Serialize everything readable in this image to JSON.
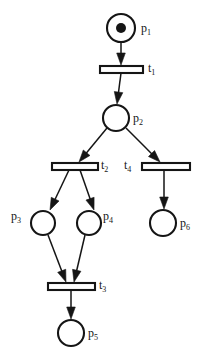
{
  "diagram": {
    "type": "petri-net",
    "width": 203,
    "height": 364,
    "background_color": "#ffffff",
    "stroke_color": "#151515",
    "fill_color": "#ffffff",
    "token_color": "#151515"
  },
  "places": [
    {
      "id": "p1",
      "label_base": "p",
      "label_sub": "1",
      "cx": 121,
      "cy": 28,
      "r": 14,
      "tokens": 1,
      "token_r": 5,
      "label_x": 141,
      "label_y": 22,
      "label_side": "right"
    },
    {
      "id": "p2",
      "label_base": "p",
      "label_sub": "2",
      "cx": 116,
      "cy": 118,
      "r": 13,
      "tokens": 0,
      "token_r": 5,
      "label_x": 133,
      "label_y": 112,
      "label_side": "right"
    },
    {
      "id": "p3",
      "label_base": "p",
      "label_sub": "3",
      "cx": 43,
      "cy": 223,
      "r": 12,
      "tokens": 0,
      "token_r": 5,
      "label_x": 11,
      "label_y": 210,
      "label_side": "left"
    },
    {
      "id": "p4",
      "label_base": "p",
      "label_sub": "4",
      "cx": 89,
      "cy": 223,
      "r": 12,
      "tokens": 0,
      "token_r": 5,
      "label_x": 103,
      "label_y": 210,
      "label_side": "right"
    },
    {
      "id": "p5",
      "label_base": "p",
      "label_sub": "5",
      "cx": 71,
      "cy": 333,
      "r": 13,
      "tokens": 0,
      "token_r": 5,
      "label_x": 88,
      "label_y": 327,
      "label_side": "right"
    },
    {
      "id": "p6",
      "label_base": "p",
      "label_sub": "6",
      "cx": 163,
      "cy": 223,
      "r": 13,
      "tokens": 0,
      "token_r": 5,
      "label_x": 180,
      "label_y": 217,
      "label_side": "right"
    }
  ],
  "transitions": [
    {
      "id": "t1",
      "label_base": "t",
      "label_sub": "1",
      "x": 100,
      "y": 66,
      "width": 43,
      "height": 7,
      "label_x": 148,
      "label_y": 62,
      "label_side": "right"
    },
    {
      "id": "t2",
      "label_base": "t",
      "label_sub": "2",
      "x": 52,
      "y": 163,
      "width": 46,
      "height": 7,
      "label_x": 101,
      "label_y": 159,
      "label_side": "right"
    },
    {
      "id": "t3",
      "label_base": "t",
      "label_sub": "3",
      "x": 48,
      "y": 283,
      "width": 47,
      "height": 7,
      "label_x": 99,
      "label_y": 279,
      "label_side": "right"
    },
    {
      "id": "t4",
      "label_base": "t",
      "label_sub": "4",
      "x": 142,
      "y": 163,
      "width": 48,
      "height": 7,
      "label_x": 124,
      "label_y": 159,
      "label_side": "left"
    }
  ],
  "arcs": [
    {
      "id": "arc-p1-t1",
      "from": "p1",
      "to": "t1",
      "x1": 121,
      "y1": 42,
      "x2": 121,
      "y2": 65
    },
    {
      "id": "arc-t1-p2",
      "from": "t1",
      "to": "p2",
      "x1": 121,
      "y1": 73,
      "x2": 117,
      "y2": 104
    },
    {
      "id": "arc-p2-t2",
      "from": "p2",
      "to": "t2",
      "x1": 107,
      "y1": 128,
      "x2": 79,
      "y2": 162
    },
    {
      "id": "arc-p2-t4",
      "from": "p2",
      "to": "t4",
      "x1": 126,
      "y1": 128,
      "x2": 160,
      "y2": 162
    },
    {
      "id": "arc-t2-p3",
      "from": "t2",
      "to": "p3",
      "x1": 69,
      "y1": 170,
      "x2": 50,
      "y2": 210
    },
    {
      "id": "arc-t2-p4",
      "from": "t2",
      "to": "p4",
      "x1": 80,
      "y1": 170,
      "x2": 94,
      "y2": 210
    },
    {
      "id": "arc-p3-t3",
      "from": "p3",
      "to": "t3",
      "x1": 48,
      "y1": 235,
      "x2": 66,
      "y2": 282
    },
    {
      "id": "arc-p4-t3",
      "from": "p4",
      "to": "t3",
      "x1": 85,
      "y1": 235,
      "x2": 74,
      "y2": 282
    },
    {
      "id": "arc-t3-p5",
      "from": "t3",
      "to": "p5",
      "x1": 71,
      "y1": 290,
      "x2": 71,
      "y2": 319
    },
    {
      "id": "arc-t4-p6",
      "from": "t4",
      "to": "p6",
      "x1": 164,
      "y1": 170,
      "x2": 164,
      "y2": 209
    }
  ]
}
